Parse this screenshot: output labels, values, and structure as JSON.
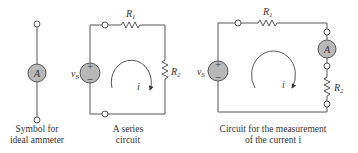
{
  "figures": [
    {
      "id": "ammeter-symbol",
      "caption_lines": [
        "Symbol for",
        "ideal ammeter"
      ],
      "meter_label": "A"
    },
    {
      "id": "series-circuit",
      "caption_lines": [
        "A series",
        "circuit"
      ],
      "source_label": "v",
      "source_sub": "S",
      "r1_label": "R",
      "r1_sub": "1",
      "r2_label": "R",
      "r2_sub": "2",
      "current_label": "i",
      "plus": "+",
      "minus": "–"
    },
    {
      "id": "measurement-circuit",
      "caption_lines": [
        "Circuit for the measurement",
        "of the current i"
      ],
      "source_label": "v",
      "source_sub": "S",
      "r1_label": "R",
      "r1_sub": "1",
      "r2_label": "R",
      "r2_sub": "2",
      "meter_label": "A",
      "current_label": "i",
      "plus": "+",
      "minus": "–"
    }
  ]
}
